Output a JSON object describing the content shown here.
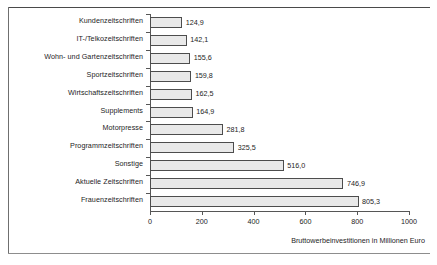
{
  "chart_data": {
    "type": "bar",
    "orientation": "horizontal",
    "title": "",
    "subtitle": "",
    "xlabel": "Bruttowerbeinvestitionen in Millionen Euro",
    "ylabel": "",
    "categories": [
      "Kundenzeitschriften",
      "IT-/Telkozeitschriften",
      "Wohn- und Gartenzeitschriften",
      "Sportzeitschriften",
      "Wirtschaftszeitschriften",
      "Supplements",
      "Motorpresse",
      "Programmzeitschriften",
      "Sonstige",
      "Aktuelle Zeitschriften",
      "Frauenzeitschriften"
    ],
    "values": [
      124.9,
      142.1,
      155.6,
      159.8,
      162.5,
      164.9,
      281.8,
      325.5,
      516.0,
      746.9,
      805.3
    ],
    "value_labels": [
      "124,9",
      "142,1",
      "155,6",
      "159,8",
      "162,5",
      "164,9",
      "281,8",
      "325,5",
      "516,0",
      "746,9",
      "805,3"
    ],
    "xlim": [
      0,
      1000
    ],
    "xticks": [
      0,
      200,
      400,
      600,
      800,
      1000
    ],
    "xtick_labels": [
      "0",
      "200",
      "400",
      "600",
      "800",
      "1000"
    ],
    "grid": false,
    "legend": null,
    "bar_fill": "#e9e9e9",
    "bar_border": "#4d4d4d",
    "axis_color": "#565656",
    "text_color": "#1d1d1d"
  }
}
